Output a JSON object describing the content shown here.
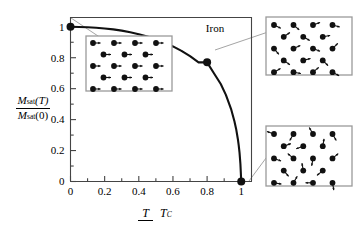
{
  "figure": {
    "title_label": "Iron",
    "axes": {
      "y_label_numerator": "Msat(T)",
      "y_label_denominator": "Msat(0)",
      "y_label_num_M": "M",
      "y_label_num_sub": "sat",
      "y_label_num_arg": "(T)",
      "y_label_den_M": "M",
      "y_label_den_sub": "sat",
      "y_label_den_arg": "(0)",
      "x_label_numerator": "T",
      "x_label_denominator": "TC",
      "x_label_den_T": "T",
      "x_label_den_sub": "C"
    },
    "insets": [
      {
        "name": "ordered-spins-inset",
        "description": "aligned ferromagnetic spins, all arrows pointing right",
        "rows": [
          4,
          3,
          4,
          3,
          4
        ],
        "angles_deg": [
          0,
          0,
          0,
          0,
          0
        ]
      },
      {
        "name": "partially-disordered-spins-inset",
        "description": "partially disordered spins near Curie temperature",
        "angles_deg": [
          -25,
          -40,
          20,
          -15,
          35,
          -30,
          10,
          -50,
          25,
          -20,
          45,
          -35,
          15,
          -45,
          30,
          -10,
          40,
          -28,
          18,
          -38
        ]
      },
      {
        "name": "randomized-spins-inset",
        "description": "fully randomized paramagnetic spins above Curie temperature",
        "angles_deg": [
          160,
          240,
          120,
          300,
          20,
          200,
          80,
          340,
          140,
          260,
          40,
          310,
          100,
          220,
          350,
          60,
          180,
          280,
          130,
          10
        ]
      }
    ]
  },
  "chart_data": {
    "type": "line",
    "title": "Iron",
    "xlabel": "T / T_C",
    "ylabel": "M_sat(T) / M_sat(0)",
    "xlim": [
      0,
      1.06
    ],
    "ylim": [
      0,
      1.06
    ],
    "grid": false,
    "legend": "none",
    "x_ticks_major": [
      0,
      0.2,
      0.4,
      0.6,
      0.8,
      1
    ],
    "x_tick_labels": [
      "0",
      "0.2",
      "0.4",
      "0.6",
      "0.8",
      "1"
    ],
    "x_ticks_minor": [
      0.1,
      0.3,
      0.5,
      0.7,
      0.9
    ],
    "y_ticks_major": [
      0,
      0.2,
      0.4,
      0.6,
      0.8,
      1
    ],
    "y_tick_labels": [
      "0",
      "0.2",
      "0.4",
      "0.6",
      "0.8",
      "1"
    ],
    "y_ticks_minor": [
      0.1,
      0.3,
      0.5,
      0.7,
      0.9
    ],
    "series": [
      {
        "name": "Saturation magnetization of iron vs reduced temperature",
        "x": [
          0.0,
          0.05,
          0.1,
          0.15,
          0.2,
          0.25,
          0.3,
          0.35,
          0.4,
          0.45,
          0.5,
          0.55,
          0.6,
          0.65,
          0.7,
          0.75,
          0.8,
          0.84,
          0.88,
          0.91,
          0.94,
          0.96,
          0.97,
          0.98,
          0.985,
          0.99,
          0.995,
          1.0
        ],
        "y": [
          1.0,
          0.999,
          0.997,
          0.994,
          0.989,
          0.983,
          0.975,
          0.965,
          0.952,
          0.937,
          0.919,
          0.898,
          0.873,
          0.844,
          0.81,
          0.77,
          0.77,
          0.7,
          0.63,
          0.56,
          0.47,
          0.39,
          0.34,
          0.275,
          0.235,
          0.185,
          0.115,
          0.0
        ]
      }
    ],
    "markers": [
      {
        "x": 0.0,
        "y": 1.0,
        "label": "ordered state"
      },
      {
        "x": 0.8,
        "y": 0.77,
        "label": "partially disordered state"
      },
      {
        "x": 1.0,
        "y": 0.0,
        "label": "disordered state"
      }
    ]
  }
}
